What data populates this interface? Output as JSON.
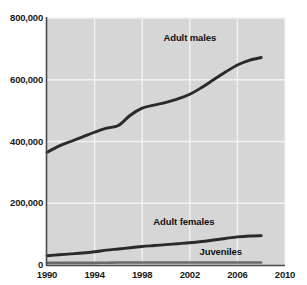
{
  "chart_data": {
    "type": "line",
    "title": "",
    "xlabel": "",
    "ylabel": "",
    "xlim": [
      1990,
      2010
    ],
    "ylim": [
      0,
      800000
    ],
    "grid": true,
    "legend_position": "inline-annotations",
    "xticks": [
      "1990",
      "1994",
      "1998",
      "2002",
      "2006",
      "2010"
    ],
    "xtick_values": [
      1990,
      1994,
      1998,
      2002,
      2006,
      2010
    ],
    "yticks": [
      "0",
      "200,000",
      "400,000",
      "600,000",
      "800,000"
    ],
    "ytick_values": [
      0,
      200000,
      400000,
      600000,
      800000
    ],
    "x": [
      1990,
      1991,
      1992,
      1993,
      1994,
      1995,
      1996,
      1997,
      1998,
      1999,
      2000,
      2001,
      2002,
      2003,
      2004,
      2005,
      2006,
      2007,
      2008
    ],
    "series": [
      {
        "name": "Adult males",
        "color": "#2a2a2a",
        "values": [
          365000,
          385000,
          400000,
          415000,
          430000,
          443000,
          452000,
          485000,
          508000,
          518000,
          527000,
          538000,
          553000,
          575000,
          600000,
          625000,
          648000,
          663000,
          672000
        ]
      },
      {
        "name": "Adult females",
        "color": "#2a2a2a",
        "values": [
          30000,
          33000,
          36000,
          39000,
          43000,
          48000,
          52000,
          56000,
          60000,
          63000,
          66000,
          69000,
          72000,
          76000,
          81000,
          86000,
          91000,
          94000,
          95000
        ]
      },
      {
        "name": "Juveniles",
        "color": "#6b6b6b",
        "values": [
          7000,
          7000,
          7000,
          7000,
          7000,
          7500,
          8000,
          8000,
          8000,
          8000,
          8000,
          8000,
          8000,
          8000,
          8000,
          8000,
          8000,
          8000,
          8000
        ]
      }
    ],
    "annotations": [
      {
        "text": "Adult males",
        "x": 2002.0,
        "y": 735000
      },
      {
        "text": "Adult females",
        "x": 2001.5,
        "y": 140000
      },
      {
        "text": "Juveniles",
        "x": 2004.6,
        "y": 42000
      }
    ],
    "colors": {
      "plot_background": "#d6d6d6",
      "gridline": "#f2f2f2",
      "axis": "#4a4a4a",
      "text": "#1a1a1a",
      "series_dark": "#2a2a2a",
      "series_gray": "#6b6b6b",
      "page_background": "#ffffff"
    }
  }
}
